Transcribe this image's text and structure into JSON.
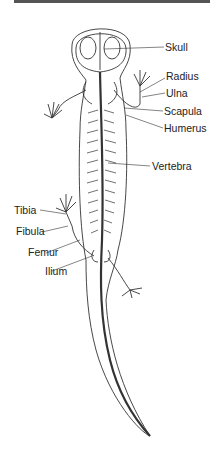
{
  "diagram": {
    "labels_right": [
      {
        "id": "skull",
        "text": "Skull"
      },
      {
        "id": "radius",
        "text": "Radius"
      },
      {
        "id": "ulna",
        "text": "Ulna"
      },
      {
        "id": "scapula",
        "text": "Scapula"
      },
      {
        "id": "humerus",
        "text": "Humerus"
      },
      {
        "id": "vertebra",
        "text": "Vertebra"
      }
    ],
    "labels_left": [
      {
        "id": "tibia",
        "text": "Tibia"
      },
      {
        "id": "fibula",
        "text": "Fibula"
      },
      {
        "id": "femur",
        "text": "Femur"
      },
      {
        "id": "ilium",
        "text": "Ilium"
      }
    ],
    "colors": {
      "line": "#333333",
      "background": "#ffffff",
      "top_strip": "#555555"
    }
  }
}
